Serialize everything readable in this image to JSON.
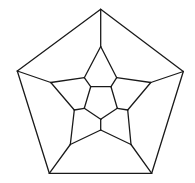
{
  "diagram": {
    "type": "dodecahedral-graph",
    "stroke_color": "#1a1a1a",
    "background": "#ffffff",
    "vertices": {
      "o0": [
        100.7,
        9.3
      ],
      "o1": [
        183.3,
        71.5
      ],
      "o2": [
        151.7,
        173.3
      ],
      "o3": [
        49.3,
        173.3
      ],
      "o4": [
        17.3,
        71.0
      ],
      "s0": [
        100.7,
        46.5
      ],
      "s1": [
        150.8,
        82.5
      ],
      "s2": [
        131.0,
        144.5
      ],
      "s3": [
        70.3,
        144.5
      ],
      "s4": [
        50.8,
        82.5
      ],
      "m0": [
        84.3,
        77.7
      ],
      "m1": [
        116.7,
        77.7
      ],
      "m2": [
        127.7,
        110.0
      ],
      "m3": [
        100.7,
        130.0
      ],
      "m4": [
        74.3,
        110.0
      ],
      "i0": [
        90.7,
        86.7
      ],
      "i1": [
        111.0,
        86.7
      ],
      "i2": [
        117.3,
        108.3
      ],
      "i3": [
        100.7,
        119.3
      ],
      "i4": [
        84.3,
        108.3
      ]
    },
    "edges": [
      [
        "o0",
        "o1"
      ],
      [
        "o1",
        "o2"
      ],
      [
        "o2",
        "o3"
      ],
      [
        "o3",
        "o4"
      ],
      [
        "o4",
        "o0"
      ],
      [
        "o0",
        "s0"
      ],
      [
        "o1",
        "s1"
      ],
      [
        "o2",
        "s2"
      ],
      [
        "o3",
        "s3"
      ],
      [
        "o4",
        "s4"
      ],
      [
        "s0",
        "m0"
      ],
      [
        "s0",
        "m1"
      ],
      [
        "s1",
        "m1"
      ],
      [
        "s1",
        "m2"
      ],
      [
        "s2",
        "m2"
      ],
      [
        "s2",
        "m3"
      ],
      [
        "s3",
        "m3"
      ],
      [
        "s3",
        "m4"
      ],
      [
        "s4",
        "m4"
      ],
      [
        "s4",
        "m0"
      ],
      [
        "m0",
        "i0"
      ],
      [
        "m1",
        "i1"
      ],
      [
        "m2",
        "i2"
      ],
      [
        "m3",
        "i3"
      ],
      [
        "m4",
        "i4"
      ],
      [
        "i0",
        "i1"
      ],
      [
        "i1",
        "i2"
      ],
      [
        "i2",
        "i3"
      ],
      [
        "i3",
        "i4"
      ],
      [
        "i4",
        "i0"
      ]
    ]
  }
}
